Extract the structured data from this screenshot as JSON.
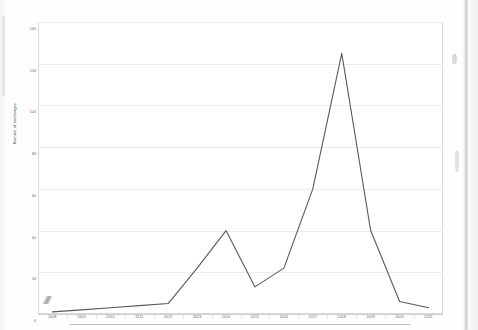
{
  "chart_data": {
    "type": "line",
    "title": "",
    "xlabel": "",
    "ylabel": "Number of exchanges",
    "categories": [
      "2008",
      "2009",
      "2010",
      "2011",
      "2012",
      "2013",
      "2014",
      "2015",
      "2016",
      "2017",
      "2018",
      "2019",
      "2020",
      "2021"
    ],
    "values": [
      1,
      2,
      3,
      4,
      5,
      22,
      40,
      13,
      22,
      60,
      125,
      40,
      6,
      3
    ],
    "series": [
      {
        "name": "Number of exchanges",
        "values": [
          1,
          2,
          3,
          4,
          5,
          22,
          40,
          13,
          22,
          60,
          125,
          40,
          6,
          3
        ]
      }
    ],
    "ylim": [
      0,
      140
    ],
    "yticks": [
      0,
      20,
      40,
      60,
      80,
      100,
      120,
      140
    ],
    "ytick_labels": [
      "0",
      "20",
      "40",
      "60",
      "80",
      "100",
      "120",
      "140"
    ],
    "grid": "horizontal",
    "legend": "none",
    "line_color": "#5a5a5a",
    "grid_color": "#ececec",
    "axis_color": "#d0d0d0"
  }
}
